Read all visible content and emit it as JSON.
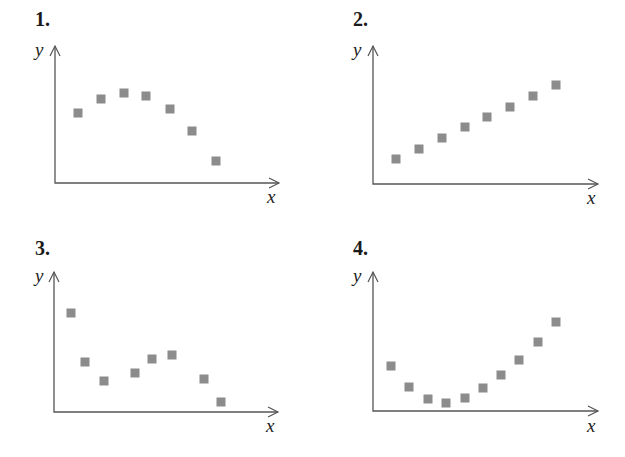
{
  "figure": {
    "marker_color": "#8c8c8c",
    "axis_color": "#555555"
  },
  "chart_data": [
    {
      "type": "scatter",
      "title": "1.",
      "xlabel": "x",
      "ylabel": "y",
      "grid": false,
      "ticks": false,
      "description": "Rises to a maximum then falls (concave down, inverted U)",
      "axes": {
        "origin": [
          55,
          183
        ],
        "x_end": 279,
        "y_top": 46
      },
      "x": [
        1,
        2,
        3,
        4,
        5,
        6,
        7
      ],
      "y": [
        5.1,
        6.1,
        6.5,
        6.3,
        5.4,
        3.8,
        1.6
      ],
      "points_px": [
        [
          78,
          113
        ],
        [
          101,
          99
        ],
        [
          124,
          93
        ],
        [
          146,
          96
        ],
        [
          170,
          109
        ],
        [
          192,
          131
        ],
        [
          216,
          161
        ]
      ]
    },
    {
      "type": "scatter",
      "title": "2.",
      "xlabel": "x",
      "ylabel": "y",
      "grid": false,
      "ticks": false,
      "description": "Steady linear increase (positive linear trend)",
      "axes": {
        "origin": [
          373,
          184
        ],
        "x_end": 598,
        "y_top": 46
      },
      "x": [
        1,
        2,
        3,
        4,
        5,
        6,
        7,
        8
      ],
      "y": [
        1.8,
        2.6,
        3.3,
        4.1,
        4.9,
        5.6,
        6.4,
        7.2
      ],
      "points_px": [
        [
          396,
          159
        ],
        [
          419,
          149
        ],
        [
          442,
          138
        ],
        [
          465,
          127
        ],
        [
          487,
          117
        ],
        [
          510,
          107
        ],
        [
          533,
          96
        ],
        [
          556,
          85
        ]
      ]
    },
    {
      "type": "scatter",
      "title": "3.",
      "xlabel": "x",
      "ylabel": "y",
      "grid": false,
      "ticks": false,
      "description": "Falls, rises, then falls again (cubic-like pattern)",
      "axes": {
        "origin": [
          54,
          412
        ],
        "x_end": 278,
        "y_top": 272
      },
      "x": [
        1,
        2,
        3,
        4.5,
        5.3,
        6.2,
        7.7,
        8.5
      ],
      "y": [
        7.1,
        3.6,
        2.2,
        2.8,
        3.8,
        4.1,
        2.4,
        0.7
      ],
      "points_px": [
        [
          71,
          313
        ],
        [
          85,
          362
        ],
        [
          104,
          381
        ],
        [
          135,
          373
        ],
        [
          152,
          359
        ],
        [
          172,
          355
        ],
        [
          204,
          379
        ],
        [
          221,
          402
        ]
      ]
    },
    {
      "type": "scatter",
      "title": "4.",
      "xlabel": "x",
      "ylabel": "y",
      "grid": false,
      "ticks": false,
      "description": "Decreases to a minimum then increases (concave up, U-shape)",
      "axes": {
        "origin": [
          373,
          411
        ],
        "x_end": 598,
        "y_top": 272
      },
      "x": [
        1,
        2,
        3,
        4,
        5,
        6,
        7,
        8,
        9,
        10
      ],
      "y": [
        3.2,
        1.7,
        0.9,
        0.6,
        0.9,
        1.6,
        2.6,
        3.7,
        5.0,
        6.4
      ],
      "points_px": [
        [
          391,
          366
        ],
        [
          409,
          387
        ],
        [
          428,
          399
        ],
        [
          446,
          403
        ],
        [
          465,
          398
        ],
        [
          483,
          388
        ],
        [
          501,
          375
        ],
        [
          519,
          360
        ],
        [
          538,
          342
        ],
        [
          556,
          322
        ]
      ]
    }
  ]
}
